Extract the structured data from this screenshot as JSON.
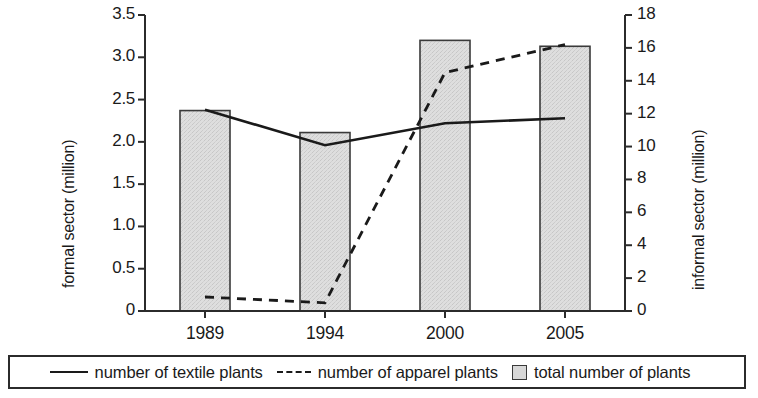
{
  "chart_data": {
    "type": "bar",
    "title": "",
    "subtitle": "",
    "xlabel": "",
    "categories": [
      "1989",
      "1994",
      "2000",
      "2005"
    ],
    "grid": false,
    "legend_position": "bottom",
    "y_left": {
      "label": "formal sector (million)",
      "ylim": [
        0,
        3.5
      ],
      "ticks": [
        "0",
        "0.5",
        "1.0",
        "1.5",
        "2.0",
        "2.5",
        "3.0",
        "3.5"
      ],
      "tick_values": [
        0,
        0.5,
        1.0,
        1.5,
        2.0,
        2.5,
        3.0,
        3.5
      ]
    },
    "y_right": {
      "label": "informal sector (million)",
      "ylim": [
        0,
        18
      ],
      "ticks": [
        "0",
        "2",
        "4",
        "6",
        "8",
        "10",
        "12",
        "14",
        "16",
        "18"
      ],
      "tick_values": [
        0,
        2,
        4,
        6,
        8,
        10,
        12,
        14,
        16,
        18
      ]
    },
    "series": [
      {
        "name": "total number of plants",
        "type": "bar",
        "axis": "left",
        "values": [
          2.37,
          2.11,
          3.2,
          3.13
        ],
        "color": "#d9d9d9",
        "edge_color": "#3a3a3a"
      },
      {
        "name": "number of textile plants",
        "type": "line",
        "style": "solid",
        "axis": "left",
        "values": [
          2.38,
          1.96,
          2.22,
          2.28
        ],
        "color": "#1a1a1a"
      },
      {
        "name": "number of apparel plants",
        "type": "line",
        "style": "dashed",
        "axis": "right",
        "values": [
          0.85,
          0.5,
          14.5,
          16.2
        ],
        "color": "#1a1a1a"
      }
    ]
  },
  "legend": {
    "items": [
      {
        "label": "number of textile plants",
        "marker": "solid-line-icon"
      },
      {
        "label": "number of apparel plants",
        "marker": "dashed-line-icon"
      },
      {
        "label": "total number of plants",
        "marker": "gray-square-swatch-icon"
      }
    ]
  }
}
